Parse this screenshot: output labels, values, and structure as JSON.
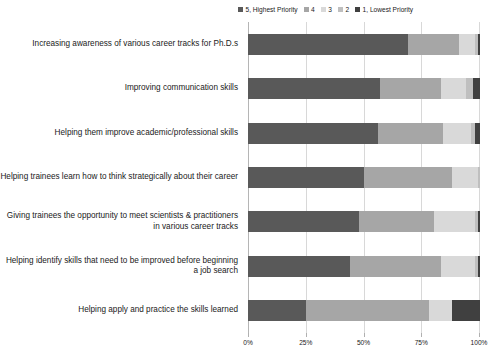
{
  "chart_data": {
    "type": "bar",
    "orientation": "horizontal",
    "stacked": true,
    "normalized": true,
    "title": "",
    "xlabel": "",
    "ylabel": "",
    "xlim": [
      0,
      100
    ],
    "xticks": [
      "0%",
      "25%",
      "50%",
      "75%",
      "100%"
    ],
    "xtick_values": [
      0,
      25,
      50,
      75,
      100
    ],
    "grid": true,
    "legend_position": "top",
    "legend": [
      {
        "name": "5, Highest Priority",
        "color": "#595959"
      },
      {
        "name": "4",
        "color": "#a6a6a6"
      },
      {
        "name": "3",
        "color": "#d9d9d9"
      },
      {
        "name": "2",
        "color": "#bfbfbf"
      },
      {
        "name": "1, Lowest Priority",
        "color": "#404040"
      }
    ],
    "categories": [
      "Increasing awareness of various career tracks for Ph.D.s",
      "Improving communication skills",
      "Helping them improve academic/professional skills",
      "Helping trainees learn how to think strategically about their career",
      "Giving trainees the opportunity to meet scientists & practitioners in various career tracks",
      "Helping identify skills that need to be improved before beginning a job search",
      "Helping apply and practice the skills learned"
    ],
    "series": [
      {
        "name": "5, Highest Priority",
        "color": "#595959",
        "values": [
          69,
          57,
          56,
          50,
          48,
          44,
          25
        ]
      },
      {
        "name": "4",
        "color": "#a6a6a6",
        "values": [
          22,
          26,
          28,
          38,
          32,
          39,
          53
        ]
      },
      {
        "name": "3",
        "color": "#d9d9d9",
        "values": [
          7,
          11,
          12,
          11,
          18,
          15,
          10
        ]
      },
      {
        "name": "2",
        "color": "#bfbfbf",
        "values": [
          1,
          3,
          2,
          1,
          1,
          1,
          0
        ]
      },
      {
        "name": "1, Lowest Priority",
        "color": "#404040",
        "values": [
          1,
          3,
          2,
          0,
          1,
          1,
          12
        ]
      }
    ]
  }
}
